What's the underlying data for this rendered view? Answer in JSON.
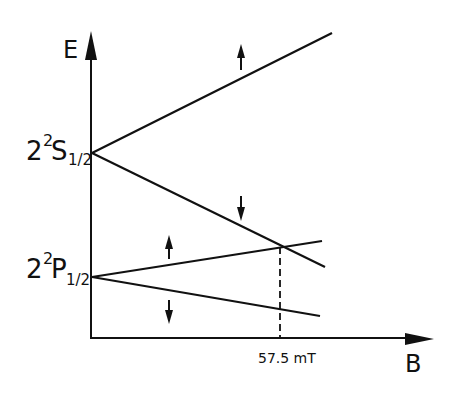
{
  "diagram": {
    "axes": {
      "y_label": "E",
      "x_label": "B"
    },
    "levels": [
      {
        "id": "2S",
        "prefix": "2",
        "sup": "2",
        "letter": "S",
        "sub": "1/2"
      },
      {
        "id": "2P",
        "prefix": "2",
        "sup": "2",
        "letter": "P",
        "sub": "1/2"
      }
    ],
    "spin_labels": {
      "up": "↑",
      "down": "↓"
    },
    "crossing": {
      "label": "57.5 mT"
    },
    "colors": {
      "ink": "#111111",
      "background": "#ffffff"
    }
  }
}
